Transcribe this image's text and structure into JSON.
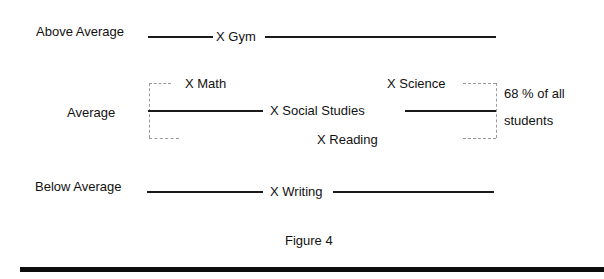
{
  "diagram": {
    "levels": {
      "above": {
        "label": "Above Average",
        "subjects": [
          "X Gym"
        ]
      },
      "average": {
        "label": "Average",
        "subjects": [
          "X Math",
          "X Social Studies",
          "X Science",
          "X Reading"
        ]
      },
      "below": {
        "label": "Below Average",
        "subjects": [
          "X Writing"
        ]
      }
    },
    "bracket_note": {
      "line1": "68 % of all",
      "line2": "students"
    },
    "caption": "Figure 4"
  }
}
